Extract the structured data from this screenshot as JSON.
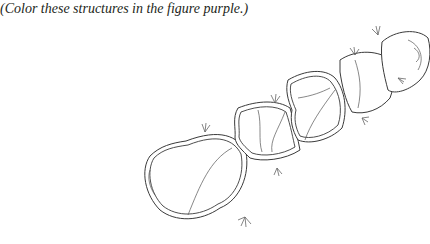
{
  "caption": "(Color these structures in the figure purple.)",
  "figure": {
    "segments": 5,
    "instruction_color": "purple"
  }
}
